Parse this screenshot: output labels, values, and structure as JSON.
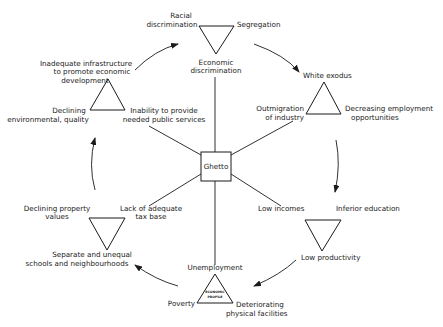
{
  "diagram": {
    "center": {
      "label": "Ghetto"
    },
    "clusters": [
      {
        "id": "discrimination",
        "orientation": "down",
        "labels": [
          "Racial",
          "discrimination",
          "Segregation",
          "Economic",
          "discrimination"
        ]
      },
      {
        "id": "exodus",
        "orientation": "up",
        "labels": [
          "White exodus",
          "Outmigration",
          "of industry",
          "Decreasing employment",
          "opportunities"
        ]
      },
      {
        "id": "education",
        "orientation": "down",
        "labels": [
          "Low incomes",
          "Inferior education",
          "Low productivity"
        ]
      },
      {
        "id": "economic-profile",
        "orientation": "up",
        "labels": [
          "Unemployment",
          "Poverty",
          "Deteriorating",
          "physical facilities",
          "ECONOMIC",
          "PROFILE"
        ]
      },
      {
        "id": "schools",
        "orientation": "down",
        "labels": [
          "Declining property",
          "values",
          "Lack of adequate",
          "tax base",
          "Separate and  unequal",
          "schools and neighbourhoods"
        ]
      },
      {
        "id": "infrastructure",
        "orientation": "up",
        "labels": [
          "Inadequate infrastructure",
          "to promote economic",
          "development",
          "Declining",
          "environmental, quality",
          "Inability to provide",
          "needed public  services"
        ]
      }
    ],
    "spokes": [
      "Economic discrimination",
      "Outmigration of industry",
      "Low incomes",
      "Unemployment",
      "Lack of adequate tax base",
      "Inability to provide needed public services"
    ],
    "cycle_arrows": [
      "discrimination -> exodus",
      "exodus -> education",
      "education -> economic-profile",
      "economic-profile -> schools",
      "schools -> infrastructure",
      "infrastructure -> discrimination"
    ]
  }
}
